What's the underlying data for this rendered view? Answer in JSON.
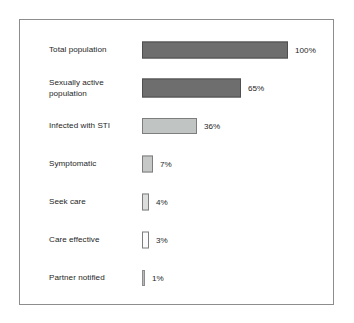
{
  "figure": {
    "background_color": "#ffffff",
    "frame_color": "#8d8d8d",
    "text_color": "#262626"
  },
  "chart_data": {
    "type": "bar",
    "orientation": "horizontal",
    "title": "",
    "subtitle": "",
    "xlabel": "",
    "ylabel": "",
    "grid": false,
    "legend": "none",
    "axis_visible": false,
    "value_unit": "%",
    "xlim": [
      0,
      100
    ],
    "categories": [
      "Total population",
      "Sexually active population",
      "Infected with STI",
      "Symptomatic",
      "Seek care",
      "Care effective",
      "Partner notified"
    ],
    "values": [
      100,
      65,
      36,
      7,
      4,
      3,
      1
    ],
    "data_labels": [
      "100%",
      "65%",
      "36%",
      "7%",
      "4%",
      "3%",
      "1%"
    ],
    "bars": [
      {
        "label": "Total population",
        "label_lines": "Total population",
        "value": 100,
        "value_label": "100%",
        "pixel_width": 146,
        "fill": "#6e6e6e",
        "stroke": "#4f4f4f",
        "height": 17
      },
      {
        "label": "Sexually active population",
        "label_lines": "Sexually active\npopulation",
        "value": 65,
        "value_label": "65%",
        "pixel_width": 99,
        "fill": "#6e6e6e",
        "stroke": "#4f4f4f",
        "height": 19
      },
      {
        "label": "Infected with STI",
        "label_lines": "Infected with STI",
        "value": 36,
        "value_label": "36%",
        "pixel_width": 55,
        "fill": "#c0c4c2",
        "stroke": "#7d7d7d",
        "height": 16
      },
      {
        "label": "Symptomatic",
        "label_lines": "Symptomatic",
        "value": 7,
        "value_label": "7%",
        "pixel_width": 11,
        "fill": "#c5c8c6",
        "stroke": "#7d7d7d",
        "height": 17
      },
      {
        "label": "Seek care",
        "label_lines": "Seek care",
        "value": 4,
        "value_label": "4%",
        "pixel_width": 7,
        "fill": "#dcdedd",
        "stroke": "#7d7d7d",
        "height": 17
      },
      {
        "label": "Care effective",
        "label_lines": "Care effective",
        "value": 3,
        "value_label": "3%",
        "pixel_width": 7,
        "fill": "#fbfbfb",
        "stroke": "#7d7d7d",
        "height": 17
      },
      {
        "label": "Partner notified",
        "label_lines": "Partner notified",
        "value": 1,
        "value_label": "1%",
        "pixel_width": 3,
        "fill": "#b9bcba",
        "stroke": "#8d8d8d",
        "height": 16
      }
    ]
  }
}
